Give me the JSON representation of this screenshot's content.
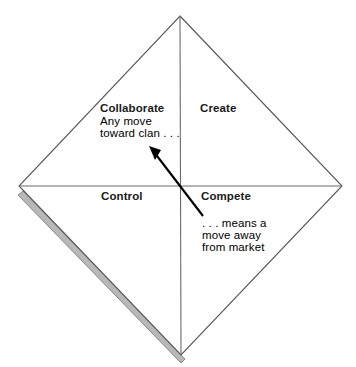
{
  "diagram": {
    "type": "quadrant-diamond",
    "shape": "diamond",
    "colors": {
      "outline": "#555555",
      "fill": "#ffffff",
      "shadow_fill": "#b8b8b8",
      "shadow_edge": "#8a8a8a",
      "divider": "#6b6b6b",
      "arrow": "#000000",
      "text": "#1a1a1a"
    },
    "quadrants": [
      {
        "id": "collaborate",
        "label": "Collaborate",
        "position": "top-left"
      },
      {
        "id": "create",
        "label": "Create",
        "position": "top-right"
      },
      {
        "id": "control",
        "label": "Control",
        "position": "bottom-left"
      },
      {
        "id": "compete",
        "label": "Compete",
        "position": "bottom-right"
      }
    ],
    "annotations": {
      "toward": {
        "id": "toward-clan",
        "lines": [
          "Any move",
          "toward clan . . ."
        ]
      },
      "away": {
        "id": "away-from-market",
        "lines": [
          ". . . means a",
          "move away",
          "from market"
        ]
      }
    },
    "arrow": {
      "id": "move-arrow",
      "from_label": "Compete",
      "to_label": "Collaborate",
      "direction": "up-left",
      "head": "at Collaborate end"
    }
  }
}
